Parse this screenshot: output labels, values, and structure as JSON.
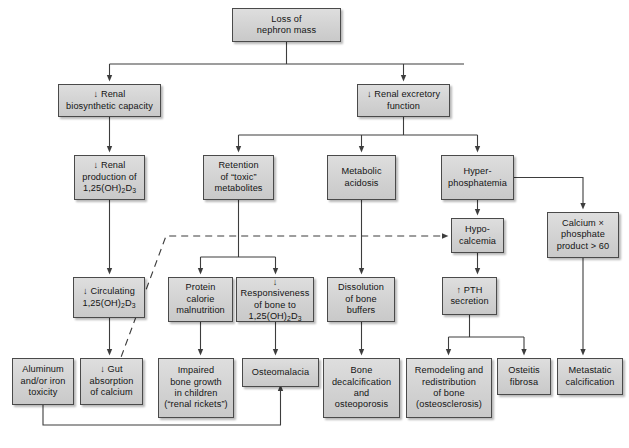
{
  "diagram": {
    "colors": {
      "node_fill": "#d6d6d6",
      "node_border": "#4a4a4a",
      "line": "#3d3d3d",
      "background": "#ffffff"
    },
    "nodes": [
      {
        "id": "loss-of-nephron-mass",
        "lines": [
          "Loss of",
          "nephron mass"
        ],
        "x": 232,
        "y": 8,
        "w": 109,
        "h": 34
      },
      {
        "id": "renal-biosynthetic-capacity",
        "lines": [
          "↓ Renal",
          "biosynthetic capacity"
        ],
        "x": 58,
        "y": 84,
        "w": 103,
        "h": 33
      },
      {
        "id": "renal-excretory-function",
        "lines": [
          "↓ Renal excretory",
          "function"
        ],
        "x": 357,
        "y": 84,
        "w": 93,
        "h": 33
      },
      {
        "id": "renal-production-vitd",
        "lines": [
          "↓ Renal",
          "production of",
          "1,25(OH)₂D₃"
        ],
        "x": 74,
        "y": 155,
        "w": 71,
        "h": 45
      },
      {
        "id": "retention-toxic-metabolites",
        "lines": [
          "Retention",
          "of “toxic”",
          "metabolites"
        ],
        "x": 203,
        "y": 155,
        "w": 71,
        "h": 45
      },
      {
        "id": "metabolic-acidosis",
        "lines": [
          "Metabolic",
          "acidosis"
        ],
        "x": 327,
        "y": 155,
        "w": 69,
        "h": 45
      },
      {
        "id": "hyperphosphatemia",
        "lines": [
          "Hyper-",
          "phosphatemia"
        ],
        "x": 441,
        "y": 155,
        "w": 73,
        "h": 45
      },
      {
        "id": "hypocalcemia",
        "lines": [
          "Hypo-",
          "calcemia"
        ],
        "x": 451,
        "y": 218,
        "w": 53,
        "h": 35
      },
      {
        "id": "calcium-phosphate-product",
        "lines": [
          "Calcium ×",
          "phosphate",
          "product > 60"
        ],
        "x": 547,
        "y": 212,
        "w": 72,
        "h": 46
      },
      {
        "id": "circulating-vitd",
        "lines": [
          "↓ Circulating",
          "1,25(OH)₂D₃"
        ],
        "x": 73,
        "y": 277,
        "w": 72,
        "h": 41
      },
      {
        "id": "protein-calorie-malnutrition",
        "lines": [
          "Protein",
          "calorie",
          "malnutrition"
        ],
        "x": 168,
        "y": 277,
        "w": 65,
        "h": 45
      },
      {
        "id": "responsiveness-of-bone",
        "lines": [
          "↓ Responsiveness",
          "of bone to",
          "1,25(OH)₂D₃"
        ],
        "x": 236,
        "y": 277,
        "w": 78,
        "h": 45
      },
      {
        "id": "dissolution-of-bone-buffers",
        "lines": [
          "Dissolution",
          "of bone",
          "buffers"
        ],
        "x": 327,
        "y": 277,
        "w": 68,
        "h": 45
      },
      {
        "id": "pth-secretion",
        "lines": [
          "↑ PTH",
          "secretion"
        ],
        "x": 442,
        "y": 277,
        "w": 55,
        "h": 38
      },
      {
        "id": "aluminum-iron-toxicity",
        "lines": [
          "Aluminum",
          "and/or iron",
          "toxicity"
        ],
        "x": 12,
        "y": 358,
        "w": 62,
        "h": 47
      },
      {
        "id": "gut-absorption-of-calcium",
        "lines": [
          "↓ Gut",
          "absorption",
          "of calcium"
        ],
        "x": 80,
        "y": 358,
        "w": 63,
        "h": 47
      },
      {
        "id": "impaired-bone-growth",
        "lines": [
          "Impaired",
          "bone growth",
          "in children",
          "(“renal rickets”)"
        ],
        "x": 158,
        "y": 358,
        "w": 76,
        "h": 60
      },
      {
        "id": "osteomalacia",
        "lines": [
          "Osteomalacia"
        ],
        "x": 242,
        "y": 358,
        "w": 77,
        "h": 29
      },
      {
        "id": "bone-decalcification",
        "lines": [
          "Bone",
          "decalcification",
          "and",
          "osteoporosis"
        ],
        "x": 323,
        "y": 358,
        "w": 77,
        "h": 60
      },
      {
        "id": "remodeling-redistribution",
        "lines": [
          "Remodeling and",
          "redistribution",
          "of bone",
          "(osteosclerosis)"
        ],
        "x": 406,
        "y": 358,
        "w": 86,
        "h": 60
      },
      {
        "id": "osteitis-fibrosa",
        "lines": [
          "Osteitis",
          "fibrosa"
        ],
        "x": 497,
        "y": 358,
        "w": 54,
        "h": 37
      },
      {
        "id": "metastatic-calcification",
        "lines": [
          "Metastatic",
          "calcification"
        ],
        "x": 557,
        "y": 358,
        "w": 66,
        "h": 37
      }
    ],
    "edges": [
      {
        "id": "edge-loss-to-biosynthetic-and-excretory",
        "kind": "split-two"
      },
      {
        "id": "edge-biosynthetic-to-renal-production",
        "kind": "straight"
      },
      {
        "id": "edge-excretory-to-three",
        "kind": "split-three"
      },
      {
        "id": "edge-renal-production-to-circulating",
        "kind": "straight"
      },
      {
        "id": "edge-retention-to-two",
        "kind": "split-two"
      },
      {
        "id": "edge-metabolic-acidosis-to-dissolution",
        "kind": "straight"
      },
      {
        "id": "edge-hyperphosphatemia-to-hypocalcemia",
        "kind": "straight"
      },
      {
        "id": "edge-hyperphosphatemia-to-calcium-product",
        "kind": "elbow"
      },
      {
        "id": "edge-hypocalcemia-to-pth",
        "kind": "straight"
      },
      {
        "id": "edge-calcium-product-to-metastatic",
        "kind": "straight"
      },
      {
        "id": "edge-circulating-to-gut-absorption",
        "kind": "straight"
      },
      {
        "id": "edge-circulating-to-hypocalcemia-dashed",
        "kind": "dashed"
      },
      {
        "id": "edge-protein-to-impaired-growth",
        "kind": "straight"
      },
      {
        "id": "edge-responsiveness-to-osteomalacia",
        "kind": "straight"
      },
      {
        "id": "edge-dissolution-to-bone-decalcification",
        "kind": "straight"
      },
      {
        "id": "edge-pth-to-remodeling-and-osteitis",
        "kind": "split-two"
      },
      {
        "id": "edge-aluminum-to-osteomalacia",
        "kind": "elbow-up"
      }
    ]
  }
}
